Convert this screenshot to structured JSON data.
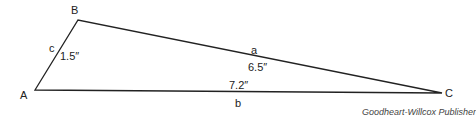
{
  "diagram": {
    "type": "triangle",
    "vertices": {
      "A": {
        "label": "A",
        "x": 35,
        "y": 90
      },
      "B": {
        "label": "B",
        "x": 78,
        "y": 20
      },
      "C": {
        "label": "C",
        "x": 442,
        "y": 93
      }
    },
    "sides": {
      "a": {
        "label": "a",
        "length": "6.5″",
        "from": "B",
        "to": "C"
      },
      "b": {
        "label": "b",
        "length": "7.2″",
        "from": "A",
        "to": "C"
      },
      "c": {
        "label": "c",
        "length": "1.5″",
        "from": "A",
        "to": "B"
      }
    },
    "stroke_color": "#222222"
  },
  "credit": "Goodheart-Willcox Publisher"
}
